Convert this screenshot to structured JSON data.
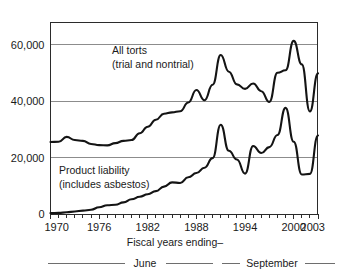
{
  "chart_data": {
    "type": "line",
    "title": "",
    "xlabel": "Fiscal years ending–",
    "ylabel": "",
    "xlim": [
      1970,
      2003
    ],
    "ylim": [
      0,
      68000
    ],
    "grid": true,
    "legend_position": "inline-annotations",
    "y_ticks": [
      0,
      20000,
      40000,
      60000
    ],
    "y_tick_labels": [
      "0",
      "20,000",
      "40,000",
      "60,000"
    ],
    "x_ticks": [
      1970,
      1976,
      1982,
      1988,
      1994,
      2000,
      2003
    ],
    "x_tick_labels": [
      "1970",
      "1976",
      "1982",
      "1988",
      "1994",
      "2000",
      "2003"
    ],
    "x_minor_ticks_every": 1,
    "x": [
      1970,
      1971,
      1972,
      1973,
      1974,
      1975,
      1976,
      1977,
      1978,
      1979,
      1980,
      1981,
      1982,
      1983,
      1984,
      1985,
      1986,
      1987,
      1988,
      1989,
      1990,
      1991,
      1992,
      1993,
      1994,
      1995,
      1996,
      1997,
      1998,
      1999,
      2000,
      2001,
      2002,
      2003
    ],
    "series": [
      {
        "name": "All torts (trial and nontrial)",
        "values": [
          25500,
          25600,
          27300,
          26200,
          25900,
          24800,
          24400,
          24300,
          25100,
          25900,
          26200,
          28600,
          30900,
          33400,
          35500,
          36000,
          36400,
          39500,
          43900,
          40300,
          45800,
          56300,
          50400,
          45900,
          44300,
          46200,
          43500,
          39700,
          50000,
          50900,
          61300,
          53000,
          36300,
          49800
        ],
        "annotation": [
          "All torts",
          "(trial and nontrial)"
        ],
        "annotation_x": 1983,
        "annotation_y": 53000
      },
      {
        "name": "Product liability (includes asbestos)",
        "values": [
          300,
          400,
          600,
          900,
          1200,
          1500,
          2400,
          3100,
          3300,
          4100,
          5200,
          6100,
          7000,
          8100,
          9700,
          11200,
          11000,
          13000,
          14500,
          16400,
          19800,
          31600,
          22400,
          19300,
          14300,
          24100,
          21600,
          23700,
          28000,
          37600,
          25600,
          14000,
          14200,
          27800
        ],
        "annotation": [
          "Product liability",
          "(includes asbestos)"
        ],
        "annotation_x": 1975,
        "annotation_y": 15500
      }
    ],
    "period_brackets": [
      {
        "label": "June",
        "start_year": 1970,
        "end_year": 1991
      },
      {
        "label": "September",
        "start_year": 1992,
        "end_year": 2003
      }
    ]
  },
  "axis": {
    "y_labels": [
      "60,000",
      "40,000",
      "20,000",
      "0"
    ],
    "x_labels": [
      "1970",
      "1976",
      "1982",
      "1988",
      "1994",
      "2000",
      "2003"
    ]
  },
  "annotations": {
    "all_torts_line1": "All torts",
    "all_torts_line2": "(trial and nontrial)",
    "product_liability_line1": "Product liability",
    "product_liability_line2": "(includes asbestos)"
  },
  "caption": {
    "axis_caption": "Fiscal years ending–",
    "bracket_june": "June",
    "bracket_september": "September"
  },
  "colors": {
    "line": "#141414",
    "grid": "#8c8c8c",
    "frame": "#2b2b2b",
    "bracket": "#6e6e6e",
    "background": "#ffffff"
  }
}
